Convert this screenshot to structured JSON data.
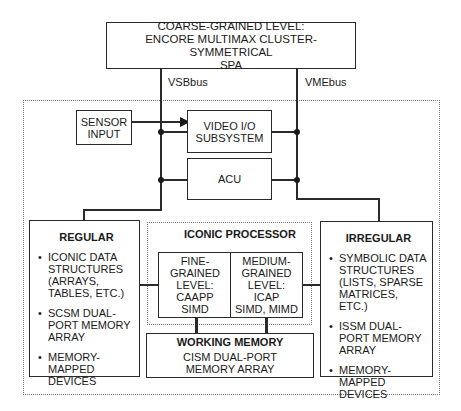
{
  "coarse": {
    "line1": "COARSE-GRAINED LEVEL:",
    "line2": "ENCORE MULTIMAX CLUSTER-SYMMETRICAL",
    "line3": "SPA"
  },
  "buses": {
    "left": "VSBbus",
    "right": "VMEbus"
  },
  "sensor": {
    "line1": "SENSOR",
    "line2": "INPUT"
  },
  "video": {
    "line1": "VIDEO I/O",
    "line2": "SUBSYSTEM"
  },
  "acu": {
    "label": "ACU"
  },
  "regular": {
    "title": "REGULAR",
    "items": [
      "ICONIC DATA STRUCTURES (ARRAYS, TABLES, ETC.)",
      "SCSM DUAL-PORT MEMORY ARRAY",
      "MEMORY-MAPPED DEVICES"
    ]
  },
  "iconic": {
    "title": "ICONIC PROCESSOR",
    "fine": [
      "FINE-",
      "GRAINED",
      "LEVEL:",
      "CAAPP",
      "SIMD"
    ],
    "medium": [
      "MEDIUM-",
      "GRAINED",
      "LEVEL:",
      "ICAP",
      "SIMD, MIMD"
    ]
  },
  "working": {
    "title": "WORKING MEMORY",
    "line1": "CISM DUAL-PORT",
    "line2": "MEMORY ARRAY"
  },
  "irregular": {
    "title": "IRREGULAR",
    "items": [
      "SYMBOLIC DATA STRUCTURES (LISTS, SPARSE MATRICES, ETC.)",
      "ISSM DUAL-PORT MEMORY ARRAY",
      "MEMORY-MAPPED DEVICES"
    ]
  }
}
